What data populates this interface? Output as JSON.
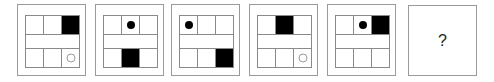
{
  "puzzle": {
    "panels": [
      {
        "id": 1,
        "top": [
          "empty",
          "empty",
          "square"
        ],
        "bottom": [
          "empty",
          "empty",
          "ring"
        ]
      },
      {
        "id": 2,
        "top": [
          "empty",
          "dot",
          "empty"
        ],
        "bottom": [
          "empty",
          "square",
          "empty"
        ]
      },
      {
        "id": 3,
        "top": [
          "dot",
          "empty",
          "empty"
        ],
        "bottom": [
          "empty",
          "empty",
          "square"
        ]
      },
      {
        "id": 4,
        "top": [
          "empty",
          "square",
          "empty"
        ],
        "bottom": [
          "empty",
          "empty",
          "ring"
        ]
      },
      {
        "id": 5,
        "top": [
          "empty",
          "dot",
          "square"
        ],
        "bottom": [
          "empty",
          "empty",
          "empty"
        ]
      }
    ],
    "answer_panel": {
      "label": "?"
    }
  },
  "colors": {
    "frame": "#9a9a9a",
    "grid": "#8a8a8a",
    "fill": "#000000",
    "ring": "#9a9a9a"
  }
}
